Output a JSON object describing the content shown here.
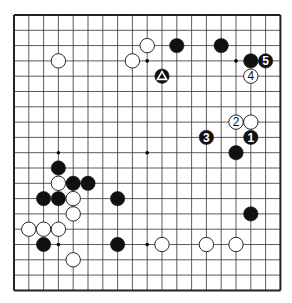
{
  "board": {
    "size": 19,
    "origin_x": 14,
    "origin_y": 15,
    "spacing_x": 14.8,
    "spacing_y": 15.3,
    "line_color": "#333333",
    "border_color": "#222222",
    "background": "#ffffff",
    "star_points": [
      [
        3,
        3
      ],
      [
        9,
        3
      ],
      [
        15,
        3
      ],
      [
        3,
        9
      ],
      [
        9,
        9
      ],
      [
        15,
        9
      ],
      [
        3,
        15
      ],
      [
        9,
        15
      ],
      [
        15,
        15
      ]
    ]
  },
  "stones": [
    {
      "color": "white",
      "col": 3,
      "row": 3
    },
    {
      "color": "white",
      "col": 8,
      "row": 3
    },
    {
      "color": "white",
      "col": 9,
      "row": 2
    },
    {
      "color": "black",
      "col": 11,
      "row": 2
    },
    {
      "color": "black",
      "col": 14,
      "row": 2
    },
    {
      "color": "black",
      "col": 16,
      "row": 3
    },
    {
      "color": "black",
      "col": 17,
      "row": 3,
      "label": "5"
    },
    {
      "color": "black",
      "col": 10,
      "row": 4,
      "mark": "triangle"
    },
    {
      "color": "white",
      "col": 16,
      "row": 4,
      "label": "4"
    },
    {
      "color": "white",
      "col": 15,
      "row": 7,
      "label": "2"
    },
    {
      "color": "white",
      "col": 16,
      "row": 7
    },
    {
      "color": "black",
      "col": 13,
      "row": 8,
      "label": "3"
    },
    {
      "color": "black",
      "col": 16,
      "row": 8,
      "label": "1"
    },
    {
      "color": "black",
      "col": 15,
      "row": 9
    },
    {
      "color": "black",
      "col": 3,
      "row": 10
    },
    {
      "color": "white",
      "col": 3,
      "row": 11
    },
    {
      "color": "black",
      "col": 4,
      "row": 11
    },
    {
      "color": "black",
      "col": 5,
      "row": 11
    },
    {
      "color": "black",
      "col": 2,
      "row": 12
    },
    {
      "color": "black",
      "col": 3,
      "row": 12
    },
    {
      "color": "white",
      "col": 4,
      "row": 12
    },
    {
      "color": "black",
      "col": 7,
      "row": 12
    },
    {
      "color": "white",
      "col": 4,
      "row": 13
    },
    {
      "color": "white",
      "col": 1,
      "row": 14
    },
    {
      "color": "white",
      "col": 2,
      "row": 14
    },
    {
      "color": "white",
      "col": 3,
      "row": 14
    },
    {
      "color": "black",
      "col": 2,
      "row": 15
    },
    {
      "color": "black",
      "col": 7,
      "row": 15
    },
    {
      "color": "white",
      "col": 10,
      "row": 15
    },
    {
      "color": "white",
      "col": 13,
      "row": 15
    },
    {
      "color": "white",
      "col": 15,
      "row": 15
    },
    {
      "color": "white",
      "col": 4,
      "row": 16
    },
    {
      "color": "black",
      "col": 16,
      "row": 13
    }
  ]
}
